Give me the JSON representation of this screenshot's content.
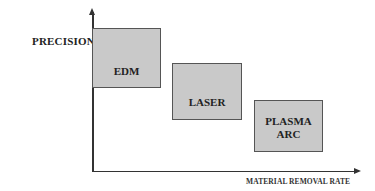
{
  "diagram": {
    "y_axis_label": "PRECISION",
    "x_axis_label": "MATERIAL REMOVAL RATE",
    "boxes": [
      {
        "label": "EDM",
        "left": 92,
        "top": 28,
        "width": 69,
        "height": 60,
        "pad_bottom": 9
      },
      {
        "label": "LASER",
        "left": 172,
        "top": 63,
        "width": 70,
        "height": 57,
        "pad_bottom": 10
      },
      {
        "label": "PLASMA\nARC",
        "line1": "PLASMA",
        "line2": "ARC",
        "left": 254,
        "top": 100,
        "width": 69,
        "height": 52,
        "pad_bottom": 10
      }
    ],
    "colors": {
      "box_fill": "#c9c9c9",
      "box_border": "#555555",
      "axis": "#333333",
      "text": "#222222"
    }
  }
}
